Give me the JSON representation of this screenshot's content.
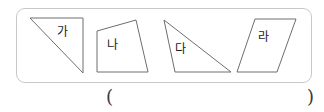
{
  "document": {
    "type": "geometry-worksheet-figure",
    "background_color": "#ffffff"
  },
  "panel": {
    "name": "shape-panel",
    "border_color": "#c9c9c9",
    "fill_color": "#ffffff",
    "corner_radius": 9
  },
  "shapes": [
    {
      "id": "ga",
      "label": "가",
      "kind": "right-triangle",
      "points": "30,18 83,18 83,73",
      "stroke": "#6e6e6e",
      "fill": "#ffffff"
    },
    {
      "id": "na",
      "label": "나",
      "kind": "quadrilateral",
      "points": "97,31 136,20 148,72 97,72",
      "stroke": "#6e6e6e",
      "fill": "#ffffff"
    },
    {
      "id": "da",
      "label": "다",
      "kind": "obtuse-triangle",
      "points": "164,20 231,72 175,72",
      "stroke": "#6e6e6e",
      "fill": "#ffffff"
    },
    {
      "id": "ra",
      "label": "라",
      "kind": "parallelogram",
      "points": "255,19 296,19 277,72 237,72",
      "stroke": "#6e6e6e",
      "fill": "#ffffff"
    }
  ],
  "answer": {
    "open_paren": "(",
    "close_paren": ")",
    "value": ""
  }
}
